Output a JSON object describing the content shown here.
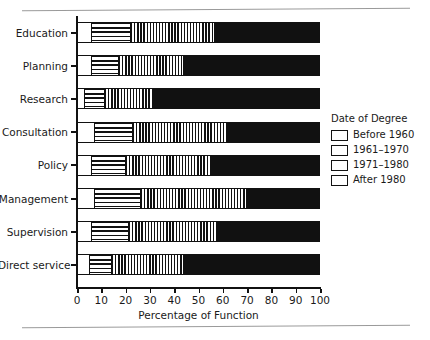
{
  "chart_data": {
    "type": "bar",
    "orientation": "horizontal",
    "stacked": true,
    "stack_mode": "percent",
    "title": "",
    "xlabel": "Percentage of Function",
    "ylabel": "",
    "xlim": [
      0,
      100
    ],
    "xticks": [
      0,
      10,
      20,
      30,
      40,
      50,
      60,
      70,
      80,
      90,
      100
    ],
    "xtick_labels": [
      "0",
      "10",
      "20",
      "30",
      "40",
      "50",
      "60",
      "70",
      "80",
      "90",
      "100"
    ],
    "grid": false,
    "legend_position": "right",
    "legend_title": "Date of Degree",
    "categories": [
      "Education",
      "Planning",
      "Research",
      "Consultation",
      "Policy",
      "Management",
      "Supervision",
      "Direct service"
    ],
    "series": [
      {
        "name": "Before 1960",
        "pattern": "solid-white",
        "color": "#ffffff",
        "values": [
          6,
          6,
          3,
          7,
          6,
          7,
          6,
          5
        ]
      },
      {
        "name": "1961–1970",
        "pattern": "horizontal-lines",
        "color": "#ffffff",
        "values": [
          16,
          11,
          8,
          16,
          14,
          19,
          15,
          9
        ]
      },
      {
        "name": "1971–1980",
        "pattern": "vertical-lines",
        "color": "#ffffff",
        "values": [
          35,
          27,
          20,
          39,
          35,
          44,
          37,
          31
        ]
      },
      {
        "name": "After 1980",
        "pattern": "solid-black",
        "color": "#111111",
        "values": [
          43,
          56,
          69,
          38,
          45,
          30,
          42,
          55
        ]
      }
    ],
    "cumulative_breaks": [
      [
        6,
        22,
        57,
        100
      ],
      [
        6,
        17,
        44,
        100
      ],
      [
        3,
        11,
        31,
        100
      ],
      [
        7,
        23,
        62,
        100
      ],
      [
        6,
        20,
        55,
        100
      ],
      [
        7,
        26,
        70,
        100
      ],
      [
        6,
        21,
        58,
        100
      ],
      [
        5,
        14,
        45,
        100
      ]
    ]
  },
  "legend": {
    "title": "Date of Degree",
    "items": [
      {
        "label": "Before 1960"
      },
      {
        "label": "1961–1970"
      },
      {
        "label": "1971–1980"
      },
      {
        "label": "After 1980"
      }
    ]
  },
  "axis": {
    "x_title": "Percentage of Function"
  }
}
